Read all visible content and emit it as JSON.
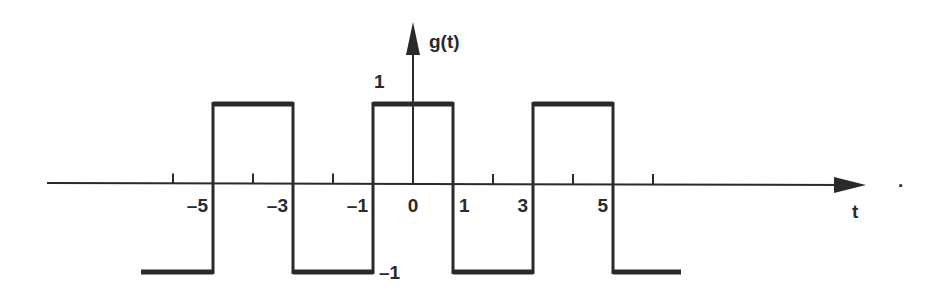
{
  "figure": {
    "y_axis_label": "g(t)",
    "x_axis_label": "t",
    "level_labels": {
      "high": "1",
      "low": "-1"
    },
    "x_tick_labels": [
      {
        "t": -5,
        "text": "–5"
      },
      {
        "t": -3,
        "text": "–3"
      },
      {
        "t": -1,
        "text": "–1"
      },
      {
        "t": 0,
        "text": "0"
      },
      {
        "t": 1,
        "text": "1"
      },
      {
        "t": 3,
        "text": "3"
      },
      {
        "t": 5,
        "text": "5"
      }
    ],
    "unlabeled_ticks": [
      -6,
      -4,
      -2,
      2,
      4,
      6
    ],
    "trailing_mark": "·"
  },
  "chart_data": {
    "type": "line",
    "title": "",
    "xlabel": "t",
    "ylabel": "g(t)",
    "xlim": [
      -9.2,
      11.3
    ],
    "ylim": [
      -1,
      1
    ],
    "segments": [
      {
        "t_start": -6.8,
        "t_end": -5,
        "value": -1
      },
      {
        "t_start": -5,
        "t_end": -3,
        "value": 1
      },
      {
        "t_start": -3,
        "t_end": -1,
        "value": -1
      },
      {
        "t_start": -1,
        "t_end": 1,
        "value": 1
      },
      {
        "t_start": 1,
        "t_end": 3,
        "value": -1
      },
      {
        "t_start": 3,
        "t_end": 5,
        "value": 1
      },
      {
        "t_start": 5,
        "t_end": 6.7,
        "value": -1
      }
    ],
    "grid": false,
    "legend": "none"
  }
}
